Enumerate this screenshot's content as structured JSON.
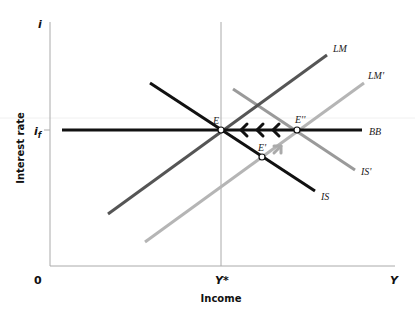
{
  "axes": {
    "y_symbol": "i",
    "y_title": "Interest rate",
    "x_symbol": "Y",
    "x_title": "Income",
    "origin": "0",
    "if_label": "i",
    "if_sub": "f",
    "ystar_label": "Y*"
  },
  "curves": {
    "lm": "LM",
    "lm_prime": "LM'",
    "is": "IS",
    "is_prime": "IS'",
    "bb": "BB"
  },
  "points": {
    "e": "E",
    "e_prime": "E'",
    "e_double_prime": "E''"
  },
  "colors": {
    "bb": "#111111",
    "is": "#111111",
    "lm": "#555555",
    "lm_prime": "#b5b5b5",
    "is_prime": "#9a9a9a",
    "axis": "#aaaaaa"
  }
}
